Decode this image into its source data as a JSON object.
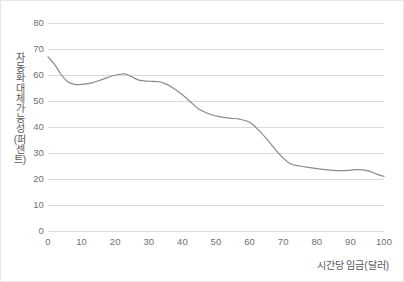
{
  "chart_data": {
    "type": "line",
    "title": "",
    "subtitle": "",
    "xlabel": "시간당 임금(달러)",
    "ylabel": "자동화 대체 가능성(퍼센트)",
    "xlim": [
      0,
      100
    ],
    "ylim": [
      0,
      80
    ],
    "xticks": [
      0,
      10,
      20,
      30,
      40,
      50,
      60,
      70,
      80,
      90,
      100
    ],
    "yticks": [
      0,
      10,
      20,
      30,
      40,
      50,
      60,
      70,
      80
    ],
    "grid": "horizontal-only",
    "legend": "none",
    "line_color": "#8a8a8a",
    "gridline_color": "#d9d9d9",
    "tick_label_color": "#6f6f6f",
    "axis_title_color": "#595959",
    "series": [
      {
        "name": "자동화 대체 가능성",
        "x": [
          0,
          2,
          4,
          6,
          8,
          10,
          13,
          16,
          19,
          21,
          23,
          25,
          27,
          30,
          33,
          35,
          37,
          40,
          43,
          45,
          48,
          51,
          54,
          57,
          60,
          63,
          66,
          69,
          72,
          75,
          78,
          81,
          84,
          87,
          90,
          92,
          95,
          98,
          100
        ],
        "y": [
          67.0,
          64.0,
          60.0,
          57.3,
          56.4,
          56.4,
          57.0,
          58.2,
          59.6,
          60.2,
          60.4,
          59.3,
          58.0,
          57.6,
          57.4,
          56.6,
          55.2,
          52.4,
          49.0,
          46.8,
          45.0,
          44.0,
          43.4,
          43.0,
          41.8,
          38.4,
          34.0,
          29.4,
          26.0,
          25.0,
          24.4,
          23.8,
          23.4,
          23.2,
          23.4,
          23.6,
          23.2,
          21.8,
          21.0
        ]
      }
    ]
  },
  "axis": {
    "y_tick_labels": [
      "80",
      "70",
      "60",
      "50",
      "40",
      "30",
      "20",
      "10",
      "0"
    ],
    "x_tick_labels": [
      "0",
      "10",
      "20",
      "30",
      "40",
      "50",
      "60",
      "70",
      "80",
      "90",
      "100"
    ]
  }
}
